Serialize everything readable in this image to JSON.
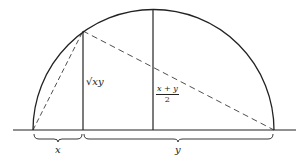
{
  "diagram": {
    "title": "",
    "labels": {
      "sqrt_xy": "√xy",
      "mean_numerator": "x + y",
      "mean_denominator": "2",
      "x_segment": "x",
      "y_segment": "y"
    },
    "colors": {
      "stroke": "#222222",
      "background": "#ffffff"
    }
  }
}
